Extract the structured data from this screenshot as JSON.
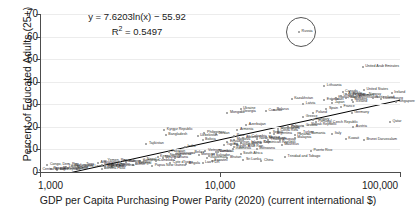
{
  "chart_data": {
    "type": "scatter",
    "title": "",
    "xlabel": "GDP per Capita Purchasing Power Parity (2020) (current international $)",
    "ylabel": "Percent of Educated Adults (25+)",
    "xscale": "log",
    "xlim": [
      1000,
      100000
    ],
    "ylim": [
      0,
      70
    ],
    "xticks": [
      "1,000",
      "10,000",
      "100,000"
    ],
    "xtick_values": [
      1000,
      10000,
      100000
    ],
    "yticks": [
      "0",
      "10",
      "20",
      "30",
      "40",
      "50",
      "60",
      "70"
    ],
    "ytick_values": [
      0,
      10,
      20,
      30,
      40,
      50,
      60,
      70
    ],
    "grid": "horizontal",
    "legend": "none",
    "annotations": {
      "equation": "y = 7.6203ln(x) − 55.92",
      "r_squared_label": "R",
      "r_squared_sup": "2",
      "r_squared_value": " = 0.5497",
      "highlight": {
        "label": "Russia",
        "shape": "circle",
        "note": "Russia circled as outlier"
      }
    },
    "trendline": {
      "type": "logarithmic",
      "formula": "y = 7.6203*ln(x) - 55.92",
      "coefficient": 7.6203,
      "intercept": -55.92,
      "r_squared": 0.5497,
      "color": "#000000"
    },
    "marker_color": "#8c8c8c",
    "points": [
      {
        "name": "Congo, Dem. Rep.",
        "x": 1100,
        "y": 3.0
      },
      {
        "name": "Niger",
        "x": 1250,
        "y": 1.0
      },
      {
        "name": "Mozambique",
        "x": 1300,
        "y": 1.5
      },
      {
        "name": "Liberia",
        "x": 1400,
        "y": 2.0
      },
      {
        "name": "Madagascar",
        "x": 1500,
        "y": 2.5
      },
      {
        "name": "Malawi",
        "x": 1550,
        "y": 1.8
      },
      {
        "name": "Sierra Leone",
        "x": 1700,
        "y": 2.2
      },
      {
        "name": "Togo",
        "x": 1750,
        "y": 3.0
      },
      {
        "name": "Chad",
        "x": 1600,
        "y": 1.2
      },
      {
        "name": "Burkina Faso",
        "x": 2200,
        "y": 1.5
      },
      {
        "name": "Rwanda",
        "x": 2300,
        "y": 2.8
      },
      {
        "name": "Guinea",
        "x": 2500,
        "y": 2.0
      },
      {
        "name": "Mali",
        "x": 2300,
        "y": 1.6
      },
      {
        "name": "Ethiopia",
        "x": 2400,
        "y": 2.4
      },
      {
        "name": "Uganda",
        "x": 2300,
        "y": 2.6
      },
      {
        "name": "Gambia, The",
        "x": 2200,
        "y": 3.2
      },
      {
        "name": "Benin",
        "x": 3300,
        "y": 3.0
      },
      {
        "name": "Tanzania",
        "x": 2700,
        "y": 2.5
      },
      {
        "name": "Zimbabwe",
        "x": 2800,
        "y": 4.5
      },
      {
        "name": "Senegal",
        "x": 3400,
        "y": 3.5
      },
      {
        "name": "Lesotho",
        "x": 2600,
        "y": 3.0
      },
      {
        "name": "Cameroon",
        "x": 3600,
        "y": 5.0
      },
      {
        "name": "Nepal",
        "x": 3800,
        "y": 5.5
      },
      {
        "name": "Tajikistan",
        "x": 3900,
        "y": 12.5
      },
      {
        "name": "Kyrgyz Republic",
        "x": 4900,
        "y": 18.5
      },
      {
        "name": "Bangladesh",
        "x": 5000,
        "y": 16.5
      },
      {
        "name": "Pakistan",
        "x": 5200,
        "y": 9.0
      },
      {
        "name": "Cambodia",
        "x": 4400,
        "y": 5.0
      },
      {
        "name": "Myanmar",
        "x": 4800,
        "y": 6.0
      },
      {
        "name": "Kenya",
        "x": 4500,
        "y": 6.5
      },
      {
        "name": "Cote d'Ivoire",
        "x": 5300,
        "y": 4.0
      },
      {
        "name": "Ghana",
        "x": 5600,
        "y": 6.0
      },
      {
        "name": "Nigeria",
        "x": 5100,
        "y": 7.0
      },
      {
        "name": "Zambia",
        "x": 3400,
        "y": 4.0
      },
      {
        "name": "Honduras",
        "x": 5500,
        "y": 7.5
      },
      {
        "name": "Nicaragua",
        "x": 5700,
        "y": 8.0
      },
      {
        "name": "India",
        "x": 6400,
        "y": 11.0
      },
      {
        "name": "Bolivia",
        "x": 8000,
        "y": 14.0
      },
      {
        "name": "Vietnam",
        "x": 8300,
        "y": 9.5
      },
      {
        "name": "Philippines",
        "x": 8200,
        "y": 17.5
      },
      {
        "name": "Morocco",
        "x": 7600,
        "y": 7.5
      },
      {
        "name": "Guatemala",
        "x": 8500,
        "y": 6.0
      },
      {
        "name": "El Salvador",
        "x": 8700,
        "y": 7.0
      },
      {
        "name": "Jordan",
        "x": 9500,
        "y": 17.0
      },
      {
        "name": "Armenia",
        "x": 12500,
        "y": 18.5
      },
      {
        "name": "Moldova",
        "x": 12000,
        "y": 14.0
      },
      {
        "name": "Mongolia",
        "x": 11000,
        "y": 26.0
      },
      {
        "name": "Georgia",
        "x": 13000,
        "y": 26.5
      },
      {
        "name": "Egypt, Arab Rep.",
        "x": 12000,
        "y": 11.0
      },
      {
        "name": "Tunisia",
        "x": 10500,
        "y": 12.0
      },
      {
        "name": "Indonesia",
        "x": 11800,
        "y": 10.0
      },
      {
        "name": "Albania",
        "x": 13500,
        "y": 15.0
      },
      {
        "name": "North Macedonia",
        "x": 16000,
        "y": 14.5
      },
      {
        "name": "Dominican Republic",
        "x": 17000,
        "y": 13.0
      },
      {
        "name": "Ecuador",
        "x": 11000,
        "y": 13.5
      },
      {
        "name": "Paraguay",
        "x": 12500,
        "y": 12.0
      },
      {
        "name": "Colombia",
        "x": 14500,
        "y": 15.5
      },
      {
        "name": "South Africa",
        "x": 13000,
        "y": 8.0
      },
      {
        "name": "Brazil",
        "x": 14500,
        "y": 12.5
      },
      {
        "name": "Peru",
        "x": 12000,
        "y": 16.0
      },
      {
        "name": "Sri Lanka",
        "x": 13500,
        "y": 5.5
      },
      {
        "name": "China",
        "x": 17000,
        "y": 5.0
      },
      {
        "name": "Serbia",
        "x": 19000,
        "y": 17.5
      },
      {
        "name": "Mexico",
        "x": 18000,
        "y": 15.0
      },
      {
        "name": "Belarus",
        "x": 20000,
        "y": 27.5
      },
      {
        "name": "Curacao",
        "x": 18000,
        "y": 27.0
      },
      {
        "name": "Kazakhstan",
        "x": 25000,
        "y": 32.5
      },
      {
        "name": "Latvia",
        "x": 29000,
        "y": 30.0
      },
      {
        "name": "Bulgaria",
        "x": 24000,
        "y": 20.0
      },
      {
        "name": "Montenegro",
        "x": 21000,
        "y": 19.0
      },
      {
        "name": "Thailand",
        "x": 18500,
        "y": 14.0
      },
      {
        "name": "Iran, Islamic Rep.",
        "x": 13000,
        "y": 13.0
      },
      {
        "name": "Costa Rica",
        "x": 21000,
        "y": 18.0
      },
      {
        "name": "Argentina",
        "x": 20000,
        "y": 17.0
      },
      {
        "name": "Chile",
        "x": 24000,
        "y": 19.5
      },
      {
        "name": "Uruguay",
        "x": 21500,
        "y": 14.0
      },
      {
        "name": "Panama",
        "x": 26000,
        "y": 16.5
      },
      {
        "name": "Trinidad and Tobago",
        "x": 23000,
        "y": 6.5
      },
      {
        "name": "Puerto Rico",
        "x": 32000,
        "y": 9.5
      },
      {
        "name": "Russia",
        "x": 27500,
        "y": 62.0
      },
      {
        "name": "Lithuania",
        "x": 38000,
        "y": 38.0
      },
      {
        "name": "Poland",
        "x": 33000,
        "y": 26.0
      },
      {
        "name": "Estonia",
        "x": 38000,
        "y": 32.0
      },
      {
        "name": "Croatia",
        "x": 29000,
        "y": 20.5
      },
      {
        "name": "Romania",
        "x": 31000,
        "y": 17.0
      },
      {
        "name": "Hungary",
        "x": 33000,
        "y": 23.0
      },
      {
        "name": "Slovak Republic",
        "x": 31000,
        "y": 21.0
      },
      {
        "name": "Czech Republic",
        "x": 41000,
        "y": 21.5
      },
      {
        "name": "Portugal",
        "x": 34000,
        "y": 22.0
      },
      {
        "name": "Greece",
        "x": 29000,
        "y": 24.5
      },
      {
        "name": "Spain",
        "x": 39000,
        "y": 28.0
      },
      {
        "name": "Italy",
        "x": 42000,
        "y": 17.0
      },
      {
        "name": "Israel",
        "x": 42000,
        "y": 32.0
      },
      {
        "name": "Japan",
        "x": 42000,
        "y": 30.5
      },
      {
        "name": "Korea, Rep.",
        "x": 44000,
        "y": 33.0
      },
      {
        "name": "France",
        "x": 47000,
        "y": 29.0
      },
      {
        "name": "United Kingdom",
        "x": 47000,
        "y": 33.5
      },
      {
        "name": "Finland",
        "x": 50000,
        "y": 33.0
      },
      {
        "name": "Belgium",
        "x": 53000,
        "y": 34.0
      },
      {
        "name": "Canada",
        "x": 48000,
        "y": 35.5
      },
      {
        "name": "Australia",
        "x": 50000,
        "y": 34.5
      },
      {
        "name": "Germany",
        "x": 54000,
        "y": 26.0
      },
      {
        "name": "Austria",
        "x": 55000,
        "y": 20.0
      },
      {
        "name": "Sweden",
        "x": 54000,
        "y": 32.0
      },
      {
        "name": "Netherlands",
        "x": 57000,
        "y": 33.0
      },
      {
        "name": "Denmark",
        "x": 58000,
        "y": 33.5
      },
      {
        "name": "United States",
        "x": 63000,
        "y": 36.5
      },
      {
        "name": "Iceland",
        "x": 55000,
        "y": 31.0
      },
      {
        "name": "Switzerland",
        "x": 71000,
        "y": 33.0
      },
      {
        "name": "Norway",
        "x": 65000,
        "y": 34.0
      },
      {
        "name": "Ireland",
        "x": 90000,
        "y": 35.0
      },
      {
        "name": "Luxembourg",
        "x": 78000,
        "y": 32.5
      },
      {
        "name": "Singapore",
        "x": 95000,
        "y": 31.0
      },
      {
        "name": "Kuwait",
        "x": 50000,
        "y": 14.5
      },
      {
        "name": "Brunei Darussalam",
        "x": 63000,
        "y": 14.0
      },
      {
        "name": "Qatar",
        "x": 88000,
        "y": 22.0
      },
      {
        "name": "United Arab Emirates",
        "x": 62000,
        "y": 46.5
      },
      {
        "name": "Malaysia",
        "x": 26000,
        "y": 15.0
      },
      {
        "name": "Turkey",
        "x": 28000,
        "y": 17.5
      },
      {
        "name": "Mauritius",
        "x": 22000,
        "y": 12.0
      },
      {
        "name": "Botswana",
        "x": 16000,
        "y": 10.0
      },
      {
        "name": "Namibia",
        "x": 9500,
        "y": 9.0
      },
      {
        "name": "Eswatini",
        "x": 9000,
        "y": 5.0
      },
      {
        "name": "Angola",
        "x": 6500,
        "y": 3.5
      },
      {
        "name": "Jamaica",
        "x": 9700,
        "y": 9.0
      },
      {
        "name": "Belize",
        "x": 7000,
        "y": 8.5
      },
      {
        "name": "Fiji",
        "x": 11500,
        "y": 12.0
      },
      {
        "name": "Ukraine",
        "x": 13000,
        "y": 28.0
      },
      {
        "name": "Azerbaijan",
        "x": 14000,
        "y": 21.0
      },
      {
        "name": "Uzbekistan",
        "x": 7500,
        "y": 16.0
      },
      {
        "name": "Bhutan",
        "x": 11000,
        "y": 6.0
      },
      {
        "name": "Lao PDR",
        "x": 8000,
        "y": 4.0
      },
      {
        "name": "Papua New Guinea",
        "x": 4200,
        "y": 2.5
      },
      {
        "name": "Haiti",
        "x": 3000,
        "y": 4.5
      },
      {
        "name": "Yemen, Rep.",
        "x": 2300,
        "y": 5.0
      },
      {
        "name": "Afghanistan",
        "x": 2100,
        "y": 4.0
      },
      {
        "name": "Burundi",
        "x": 1150,
        "y": 1.5
      },
      {
        "name": "Central African Republic",
        "x": 1000,
        "y": 1.0
      }
    ]
  }
}
